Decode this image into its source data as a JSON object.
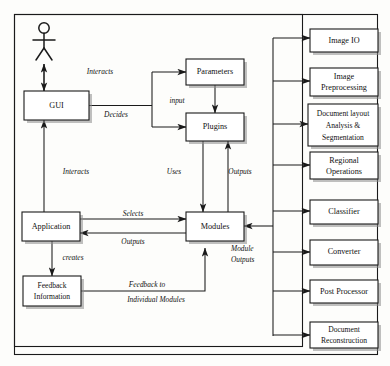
{
  "diagram": {
    "actor": {
      "name": "user-actor",
      "label": ""
    },
    "colors": {
      "stroke": "#1a1a1a",
      "box_fill": "#ffffff",
      "shadow": "#8d8d8d",
      "background": "#fdfdfb"
    },
    "core_nodes": [
      {
        "id": "gui",
        "label": "GUI",
        "x": 24,
        "y": 91,
        "w": 65,
        "h": 29,
        "lines": [
          "GUI"
        ]
      },
      {
        "id": "parameters",
        "label": "Parameters",
        "x": 186,
        "y": 59,
        "w": 58,
        "h": 26,
        "lines": [
          "Parameters"
        ]
      },
      {
        "id": "plugins",
        "label": "Plugins",
        "x": 186,
        "y": 113,
        "w": 58,
        "h": 28,
        "lines": [
          "Plugins"
        ]
      },
      {
        "id": "application",
        "label": "Application",
        "x": 22,
        "y": 212,
        "w": 58,
        "h": 29,
        "lines": [
          "Application"
        ]
      },
      {
        "id": "modules",
        "label": "Modules",
        "x": 186,
        "y": 212,
        "w": 58,
        "h": 29,
        "lines": [
          "Modules"
        ]
      },
      {
        "id": "feedback-information",
        "label": "Feedback Information",
        "x": 23,
        "y": 276,
        "w": 58,
        "h": 30,
        "lines": [
          "Feedback",
          "Information"
        ]
      }
    ],
    "module_nodes": [
      {
        "id": "image-io",
        "label": "Image IO",
        "x": 310,
        "y": 29,
        "w": 68,
        "h": 23,
        "lines": [
          "Image IO"
        ]
      },
      {
        "id": "image-preprocessing",
        "label": "Image Preprocessing",
        "x": 310,
        "y": 68,
        "w": 68,
        "h": 28,
        "lines": [
          "Image",
          "Preprocessing"
        ]
      },
      {
        "id": "document-layout-analysis-segmentation",
        "label": "Document layout Analysis & Segmentation",
        "x": 308,
        "y": 104,
        "w": 70,
        "h": 42,
        "lines": [
          "Document layout",
          "Analysis &",
          "Segmentation"
        ]
      },
      {
        "id": "regional-operations",
        "label": "Regional Operations",
        "x": 310,
        "y": 152,
        "w": 68,
        "h": 27,
        "lines": [
          "Regional",
          "Operations"
        ]
      },
      {
        "id": "classifier",
        "label": "Classifier",
        "x": 310,
        "y": 200,
        "w": 68,
        "h": 24,
        "lines": [
          "Classifier"
        ]
      },
      {
        "id": "converter",
        "label": "Converter",
        "x": 310,
        "y": 240,
        "w": 68,
        "h": 25,
        "lines": [
          "Converter"
        ]
      },
      {
        "id": "post-processor",
        "label": "Post Processor",
        "x": 310,
        "y": 280,
        "w": 68,
        "h": 23,
        "lines": [
          "Post Processor"
        ]
      },
      {
        "id": "document-reconstruction",
        "label": "Document Reconstruction",
        "x": 310,
        "y": 322,
        "w": 68,
        "h": 26,
        "lines": [
          "Document",
          "Reconstruction"
        ]
      }
    ],
    "edge_labels": [
      {
        "id": "interacts-top",
        "text": "Interacts",
        "x": 100,
        "y": 72
      },
      {
        "id": "decides",
        "text": "Decides",
        "x": 116,
        "y": 114
      },
      {
        "id": "input",
        "text": "input",
        "x": 178,
        "y": 101
      },
      {
        "id": "interacts-bottom",
        "text": "Interacts",
        "x": 76,
        "y": 172
      },
      {
        "id": "uses",
        "text": "Uses",
        "x": 174,
        "y": 172
      },
      {
        "id": "outputs-plugins",
        "text": "Outputs",
        "x": 236,
        "y": 172
      },
      {
        "id": "selects",
        "text": "Selects",
        "x": 133,
        "y": 217
      },
      {
        "id": "outputs-modules",
        "text": "Outputs",
        "x": 133,
        "y": 241
      },
      {
        "id": "module-outputs",
        "text": "Module Outputs",
        "x": 248,
        "y": 250,
        "lines": [
          "Module",
          "Outputs"
        ]
      },
      {
        "id": "creates",
        "text": "creates",
        "x": 70,
        "y": 258
      },
      {
        "id": "feedback-to-individual-modules",
        "text": "Feedback to Individual Modules",
        "x": 156,
        "y": 292,
        "lines": [
          "Feedback to",
          "Individual Modules"
        ]
      }
    ],
    "frames": [
      {
        "id": "outer-frame",
        "x": 14,
        "y": 14,
        "w": 364,
        "h": 341
      },
      {
        "id": "inner-frame",
        "x": 14,
        "y": 14,
        "w": 289,
        "h": 333
      }
    ]
  }
}
